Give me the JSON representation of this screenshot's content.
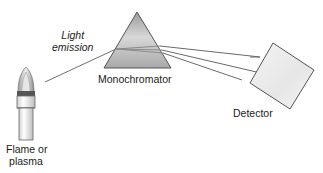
{
  "diagram": {
    "labels": {
      "light_emission_line1": "Light",
      "light_emission_line2": "emission",
      "monochromator": "Monochromator",
      "detector": "Detector",
      "source_line1": "Flame or",
      "source_line2": "plasma"
    },
    "components": [
      {
        "name": "flame-or-plasma-source",
        "type": "torch"
      },
      {
        "name": "monochromator",
        "type": "prism"
      },
      {
        "name": "detector",
        "type": "square"
      }
    ],
    "colors": {
      "line": "#666666",
      "prism_fill": "#bdbdbd",
      "detector_fill": "#ededed",
      "text": "#222222"
    }
  }
}
